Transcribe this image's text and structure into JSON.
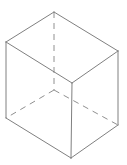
{
  "figure": {
    "name": "cube-wireframe",
    "background_color": "#ffffff",
    "visible_edge_color": "#808080",
    "hidden_edge_color": "#909090",
    "stroke_width": 1,
    "hidden_dash_pattern": "6 5",
    "canvas": {
      "width": 127,
      "height": 165
    }
  },
  "geometry": {
    "vertices": {
      "top_apex": {
        "label": "top-apex",
        "x": 54,
        "y": 12,
        "hidden": false
      },
      "top_left": {
        "label": "top-left",
        "x": 6,
        "y": 42,
        "hidden": false
      },
      "top_right": {
        "label": "top-right",
        "x": 118,
        "y": 51,
        "hidden": false
      },
      "top_front": {
        "label": "top-front",
        "x": 72,
        "y": 83,
        "hidden": false
      },
      "bottom_back": {
        "label": "bottom-back",
        "x": 54,
        "y": 90,
        "hidden": true
      },
      "bottom_left": {
        "label": "bottom-left",
        "x": 6,
        "y": 118,
        "hidden": false
      },
      "bottom_right": {
        "label": "bottom-right",
        "x": 118,
        "y": 125,
        "hidden": false
      },
      "bottom_front": {
        "label": "bottom-front",
        "x": 71,
        "y": 158,
        "hidden": false
      }
    },
    "visible_edges": [
      {
        "name": "top-apex-to-top-left",
        "x1": 54,
        "y1": 12,
        "x2": 6,
        "y2": 42
      },
      {
        "name": "top-apex-to-top-right",
        "x1": 54,
        "y1": 12,
        "x2": 118,
        "y2": 51
      },
      {
        "name": "top-left-to-top-front",
        "x1": 6,
        "y1": 42,
        "x2": 72,
        "y2": 83
      },
      {
        "name": "top-right-to-top-front",
        "x1": 118,
        "y1": 51,
        "x2": 72,
        "y2": 83
      },
      {
        "name": "left-vertical-edge",
        "x1": 6,
        "y1": 42,
        "x2": 6,
        "y2": 118
      },
      {
        "name": "right-vertical-edge",
        "x1": 118,
        "y1": 51,
        "x2": 118,
        "y2": 125
      },
      {
        "name": "front-vertical-edge",
        "x1": 72,
        "y1": 83,
        "x2": 71,
        "y2": 158
      },
      {
        "name": "bottom-left-to-bottom-front",
        "x1": 6,
        "y1": 118,
        "x2": 71,
        "y2": 158
      },
      {
        "name": "bottom-right-to-bottom-front",
        "x1": 118,
        "y1": 125,
        "x2": 71,
        "y2": 158
      }
    ],
    "hidden_edges": [
      {
        "name": "back-vertical-edge",
        "x1": 54,
        "y1": 12,
        "x2": 54,
        "y2": 90
      },
      {
        "name": "bottom-back-to-bottom-left",
        "x1": 54,
        "y1": 90,
        "x2": 6,
        "y2": 118
      },
      {
        "name": "bottom-back-to-bottom-right",
        "x1": 54,
        "y1": 90,
        "x2": 118,
        "y2": 125
      }
    ],
    "faces": [
      {
        "name": "top-face",
        "points": "54,12 118,51 72,83 6,42",
        "hidden": false
      },
      {
        "name": "left-face",
        "points": "6,42 72,83 71,158 6,118",
        "hidden": false
      },
      {
        "name": "right-face",
        "points": "72,83 118,51 118,125 71,158",
        "hidden": false
      }
    ]
  }
}
